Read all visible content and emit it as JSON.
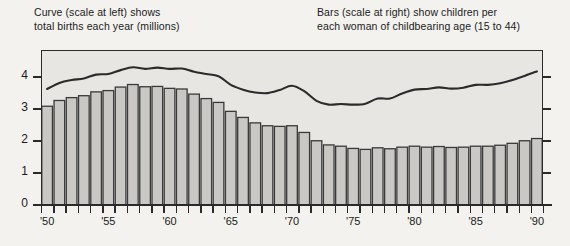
{
  "captions": {
    "left": "Curve (scale at left) shows\ntotal births each year (millions)",
    "right": "Bars (scale at right) show children per\neach woman of childbearing age (15 to 44)"
  },
  "colors": {
    "page_background": "#f3f2ef",
    "plot_background": "#e7e6e2",
    "bar_fill": "#c9c8c4",
    "bar_stroke": "#3a3a3a",
    "curve": "#2b2b2b",
    "axis": "#2a2a2a",
    "text": "#1a1a1a"
  },
  "chart_data": {
    "type": "bar",
    "title": "",
    "subtitle": "",
    "xlabel": "",
    "ylabel": "",
    "grid": false,
    "legend_position": "top",
    "x": [
      1950,
      1951,
      1952,
      1953,
      1954,
      1955,
      1956,
      1957,
      1958,
      1959,
      1960,
      1961,
      1962,
      1963,
      1964,
      1965,
      1966,
      1967,
      1968,
      1969,
      1970,
      1971,
      1972,
      1973,
      1974,
      1975,
      1976,
      1977,
      1978,
      1979,
      1980,
      1981,
      1982,
      1983,
      1984,
      1985,
      1986,
      1987,
      1988,
      1989,
      1990
    ],
    "tick_labels": [
      "'50",
      "'55",
      "'60",
      "'65",
      "'70",
      "'75",
      "'80",
      "'85",
      "'90"
    ],
    "tick_years": [
      1950,
      1955,
      1960,
      1965,
      1970,
      1975,
      1980,
      1985,
      1990
    ],
    "left_axis": {
      "name": "total births each year (millions)",
      "ticks": [
        0,
        1,
        2,
        3,
        4
      ],
      "tick_labels": [
        "0",
        "1",
        "2",
        "3",
        "4"
      ],
      "ylim": [
        0,
        4.85
      ],
      "labeled": true
    },
    "right_axis": {
      "name": "children per woman of childbearing age (15 to 44)",
      "ticks": [
        1,
        2,
        3,
        4
      ],
      "tick_labels": [
        "",
        "",
        "",
        ""
      ],
      "ylim": [
        0,
        4.85
      ],
      "labeled": false
    },
    "series": [
      {
        "name": "Bars (scale at right) show children per each woman of childbearing age (15 to 44)",
        "type": "bar",
        "axis": "right",
        "values": [
          3.09,
          3.27,
          3.36,
          3.42,
          3.54,
          3.58,
          3.69,
          3.77,
          3.7,
          3.71,
          3.65,
          3.63,
          3.47,
          3.33,
          3.21,
          2.93,
          2.74,
          2.57,
          2.48,
          2.46,
          2.48,
          2.27,
          2.01,
          1.88,
          1.84,
          1.77,
          1.74,
          1.79,
          1.76,
          1.81,
          1.84,
          1.81,
          1.83,
          1.8,
          1.81,
          1.84,
          1.84,
          1.87,
          1.93,
          2.01,
          2.08
        ]
      },
      {
        "name": "Curve (scale at left) shows total births each year (millions)",
        "type": "line",
        "axis": "left",
        "values": [
          3.63,
          3.82,
          3.91,
          3.96,
          4.08,
          4.1,
          4.22,
          4.31,
          4.26,
          4.3,
          4.26,
          4.27,
          4.17,
          4.1,
          4.03,
          3.76,
          3.61,
          3.52,
          3.5,
          3.6,
          3.73,
          3.56,
          3.26,
          3.14,
          3.16,
          3.14,
          3.17,
          3.33,
          3.33,
          3.49,
          3.61,
          3.63,
          3.68,
          3.64,
          3.67,
          3.76,
          3.76,
          3.81,
          3.91,
          4.04,
          4.18
        ]
      }
    ]
  }
}
